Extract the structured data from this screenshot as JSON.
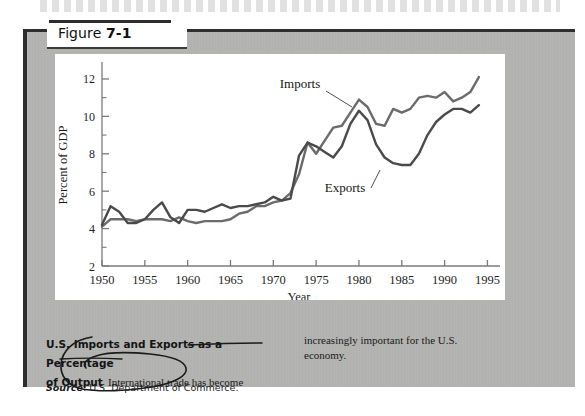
{
  "figure": {
    "tab_label_prefix": "Figure ",
    "tab_label_number": "7-1"
  },
  "caption": {
    "bold_line1": "U.S. Imports and Exports as a Percentage",
    "bold_line2": "of Output",
    "body_left": "International trade has become",
    "body_right_line1": "increasingly important for the U.S.",
    "body_right_line2": "economy."
  },
  "source": {
    "label": "Source",
    "text": ": U.S. Department of Commerce."
  },
  "annotations": {
    "pen_circle": "hand-drawn-oval-around-caption-heading",
    "pen_underline": "hand-drawn-underline-under-as-a-percentage-of-output"
  },
  "chart_data": {
    "type": "line",
    "title": "",
    "xlabel": "Year",
    "ylabel": "Percent of GDP",
    "xlim": [
      1950,
      1996
    ],
    "ylim": [
      2,
      12.8
    ],
    "xticks": [
      1950,
      1955,
      1960,
      1965,
      1970,
      1975,
      1980,
      1985,
      1990,
      1995
    ],
    "xtick_labels": [
      "1950",
      "1955",
      "1960",
      "1965",
      "1970",
      "1975",
      "1980",
      "1985",
      "1990",
      "1995"
    ],
    "yticks": [
      2,
      4,
      6,
      8,
      10,
      12
    ],
    "ytick_labels": [
      "2",
      "4",
      "6",
      "8",
      "10",
      "12"
    ],
    "y_minor_ticks": [
      3,
      5,
      7,
      9,
      11
    ],
    "grid": false,
    "legend": "inline-annotations",
    "annotations": [
      {
        "name": "Imports",
        "text": "Imports",
        "x_px": 300,
        "y_px": 88,
        "leader_to_x_px": 352,
        "leader_to_y_px": 107
      },
      {
        "name": "Exports",
        "text": "Exports",
        "x_px": 345,
        "y_px": 192,
        "leader_to_x_px": 380,
        "leader_to_y_px": 170
      }
    ],
    "x": [
      1950,
      1951,
      1952,
      1953,
      1954,
      1955,
      1956,
      1957,
      1958,
      1959,
      1960,
      1961,
      1962,
      1963,
      1964,
      1965,
      1966,
      1967,
      1968,
      1969,
      1970,
      1971,
      1972,
      1973,
      1974,
      1975,
      1976,
      1977,
      1978,
      1979,
      1980,
      1981,
      1982,
      1983,
      1984,
      1985,
      1986,
      1987,
      1988,
      1989,
      1990,
      1991,
      1992,
      1993,
      1994
    ],
    "series": [
      {
        "name": "Imports",
        "color": "#6b6b6b",
        "values": [
          4.1,
          4.5,
          4.5,
          4.5,
          4.4,
          4.5,
          4.5,
          4.5,
          4.4,
          4.6,
          4.4,
          4.3,
          4.4,
          4.4,
          4.4,
          4.5,
          4.8,
          4.9,
          5.2,
          5.2,
          5.4,
          5.5,
          5.9,
          6.9,
          8.6,
          8.0,
          8.7,
          9.4,
          9.5,
          10.2,
          10.9,
          10.5,
          9.6,
          9.5,
          10.4,
          10.2,
          10.4,
          11.0,
          11.1,
          11.0,
          11.3,
          10.8,
          11.0,
          11.3,
          12.1
        ]
      },
      {
        "name": "Exports",
        "color": "#4a4a4a",
        "values": [
          4.2,
          5.2,
          4.9,
          4.3,
          4.3,
          4.5,
          5.0,
          5.4,
          4.6,
          4.3,
          5.0,
          5.0,
          4.9,
          5.1,
          5.3,
          5.1,
          5.2,
          5.2,
          5.3,
          5.4,
          5.7,
          5.5,
          5.6,
          7.9,
          8.6,
          8.4,
          8.1,
          7.8,
          8.4,
          9.6,
          10.3,
          9.8,
          8.5,
          7.8,
          7.5,
          7.4,
          7.4,
          8.0,
          9.0,
          9.7,
          10.1,
          10.4,
          10.4,
          10.2,
          10.6
        ]
      }
    ]
  }
}
